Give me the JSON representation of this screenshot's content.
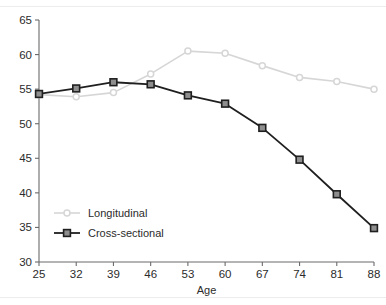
{
  "chart_data": {
    "type": "line",
    "title": "",
    "subtitle": "",
    "xlabel": "Age",
    "ylabel": "",
    "x": [
      25,
      32,
      39,
      46,
      53,
      60,
      67,
      74,
      81,
      88
    ],
    "xticks": [
      "25",
      "32",
      "39",
      "46",
      "53",
      "60",
      "67",
      "74",
      "81",
      "88"
    ],
    "yticks": [
      "30",
      "35",
      "40",
      "45",
      "50",
      "55",
      "60",
      "65"
    ],
    "xlim": [
      25,
      88
    ],
    "ylim": [
      30,
      65
    ],
    "grid": false,
    "legend_position": "lower-left",
    "series": [
      {
        "name": "Longitudinal",
        "color": "#d6d6d6",
        "marker": "circle",
        "values": [
          54.2,
          53.9,
          54.5,
          57.2,
          60.5,
          60.2,
          58.4,
          56.7,
          56.1,
          55.0
        ]
      },
      {
        "name": "Cross-sectional",
        "color": "#1f1f1f",
        "marker": "square",
        "values": [
          54.3,
          55.1,
          56.0,
          55.7,
          54.1,
          52.9,
          49.4,
          44.8,
          39.8,
          34.9
        ]
      }
    ]
  },
  "axis": {
    "spine_color": "#6b6b6b",
    "tick_color": "#6b6b6b"
  },
  "legend": {
    "items": [
      {
        "label": "Longitudinal"
      },
      {
        "label": "Cross-sectional"
      }
    ]
  }
}
